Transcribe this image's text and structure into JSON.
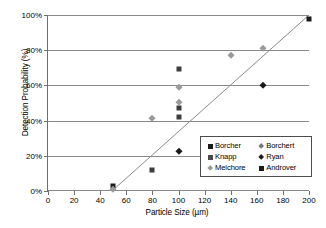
{
  "chart_data": {
    "type": "scatter",
    "title": "",
    "xlabel": "Particle Size (µm)",
    "ylabel": "Detection Probability (%)",
    "xlim": [
      0,
      200
    ],
    "ylim": [
      0,
      100
    ],
    "grid": true,
    "legend_position": "lower-right-inside",
    "x_ticks": [
      "0",
      "20",
      "40",
      "60",
      "80",
      "100",
      "120",
      "140",
      "160",
      "180",
      "200"
    ],
    "y_ticks": [
      "0%",
      "20%",
      "40%",
      "60%",
      "80%",
      "100%"
    ],
    "x_tick_values": [
      0,
      20,
      40,
      60,
      80,
      100,
      120,
      140,
      160,
      180,
      200
    ],
    "y_tick_values": [
      0,
      20,
      40,
      60,
      80,
      100
    ],
    "series": [
      {
        "name": "Borcher",
        "marker": "square",
        "color": "#1a1a1a",
        "points": [
          [
            50,
            3.0
          ]
        ]
      },
      {
        "name": "Knapp",
        "marker": "square",
        "color": "#3d3d3d",
        "points": [
          [
            80,
            12.0
          ],
          [
            100,
            42.0
          ],
          [
            100,
            47.0
          ],
          [
            100,
            69.5
          ]
        ]
      },
      {
        "name": "Melchore",
        "marker": "diamond",
        "color": "#9a9a9a",
        "points": [
          [
            50,
            1.0
          ],
          [
            80,
            41.5
          ],
          [
            100,
            50.5
          ],
          [
            100,
            59.0
          ],
          [
            140,
            77.0
          ],
          [
            165,
            81.5
          ]
        ]
      },
      {
        "name": "Borchert",
        "marker": "diamond",
        "color": "#9a9a9a",
        "points": []
      },
      {
        "name": "Ryan",
        "marker": "diamond",
        "color": "#1a1a1a",
        "points": [
          [
            100,
            22.5
          ],
          [
            165,
            60.5
          ]
        ]
      },
      {
        "name": "Androver",
        "marker": "square",
        "color": "#1a1a1a",
        "points": [
          [
            200,
            98.0
          ]
        ]
      }
    ],
    "trend_line": {
      "from": [
        49,
        0
      ],
      "to": [
        200,
        100
      ],
      "color": "#8a8a8a"
    },
    "annotations": []
  },
  "legend": {
    "rows": [
      {
        "left": {
          "label": "Borcher",
          "marker": "square",
          "color": "#1a1a1a"
        },
        "right": {
          "label": "Borchert",
          "marker": "diamond",
          "color": "#7a7a7a"
        }
      },
      {
        "left": {
          "label": "Knapp",
          "marker": "square",
          "color": "#4a4a4a"
        },
        "right": {
          "label": "Ryan",
          "marker": "diamond",
          "color": "#1a1a1a"
        }
      },
      {
        "left": {
          "label": "Melchore",
          "marker": "diamond",
          "color": "#9a9a9a"
        },
        "right": {
          "label": "Androver",
          "marker": "square",
          "color": "#1a1a1a"
        }
      }
    ]
  },
  "colors": {
    "axis": "#6e6e6e",
    "gridline": "#8a8a8a",
    "trend": "#8a8a8a",
    "background": "#ffffff",
    "text": "#000000"
  }
}
